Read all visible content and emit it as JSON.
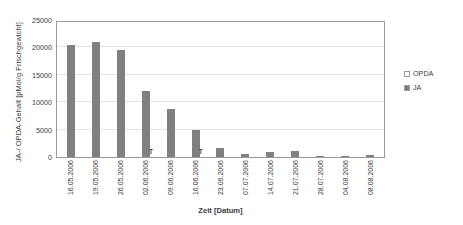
{
  "chart_data": {
    "type": "bar",
    "title": "",
    "xlabel": "Zeit [Datum]",
    "ylabel": "JA-/ OPDA-Gehalt [pMol/g Frischgewicht]",
    "ylim": [
      0,
      25000
    ],
    "yticks": [
      0,
      5000,
      10000,
      15000,
      20000,
      25000
    ],
    "ytick_labels": [
      "0",
      "5000",
      "10000",
      "15000",
      "20000",
      "25000"
    ],
    "grid": true,
    "legend_position": "right",
    "categories": [
      "16.05.2006",
      "19.05.2006",
      "26.05.2006",
      "02.06.2006",
      "09.06.2006",
      "16.06.2006",
      "23.06.2006",
      "07.07.2006",
      "14.07.2006",
      "21.07.2006",
      "28.07.2006",
      "04.08.2006",
      "08.08.2006"
    ],
    "series": [
      {
        "name": "OPDA",
        "color": "#ffffff",
        "values": [
          0,
          0,
          0,
          0,
          0,
          0,
          0,
          0,
          0,
          0,
          0,
          0,
          0
        ]
      },
      {
        "name": "JA",
        "color": "#808080",
        "values": [
          20500,
          21000,
          19600,
          12000,
          8700,
          5000,
          1600,
          500,
          1000,
          1100,
          100,
          200,
          350
        ]
      }
    ],
    "annotations": [
      {
        "text": "T",
        "category": "02.06.2006",
        "note": "error-bar marker"
      },
      {
        "text": "T",
        "category": "16.06.2006",
        "note": "error-bar marker"
      }
    ]
  },
  "legend": {
    "items": [
      {
        "label": "OPDA",
        "color": "#ffffff"
      },
      {
        "label": "JA",
        "color": "#808080"
      }
    ]
  }
}
